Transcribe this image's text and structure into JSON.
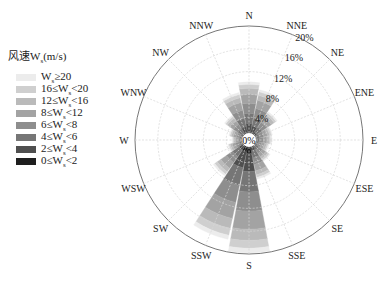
{
  "chart_data": {
    "type": "wind-rose",
    "title": "",
    "legend_title": "风速W_s(m/s)",
    "legend_position": "left",
    "radial_unit": "%",
    "radial_ticks": [
      "0%",
      "4%",
      "8%",
      "12%",
      "16%",
      "20%"
    ],
    "radial_max": 20,
    "grid": true,
    "directions": [
      "N",
      "NNE",
      "NE",
      "ENE",
      "E",
      "ESE",
      "SE",
      "SSE",
      "S",
      "SSW",
      "SW",
      "WSW",
      "W",
      "WNW",
      "NW",
      "NNW"
    ],
    "bins": [
      {
        "label": "W_s≥20",
        "color": "#ececec"
      },
      {
        "label": "16≤W_s<20",
        "color": "#cfcfcf"
      },
      {
        "label": "12≤W_s<16",
        "color": "#bababa"
      },
      {
        "label": "8≤W_s<12",
        "color": "#a3a3a3"
      },
      {
        "label": "6≤W_s<8",
        "color": "#8e8e8e"
      },
      {
        "label": "4≤W_s<6",
        "color": "#767676"
      },
      {
        "label": "2≤W_s<4",
        "color": "#4f4f4f"
      },
      {
        "label": "0≤W_s<2",
        "color": "#1e1e1e"
      }
    ],
    "total_frequency_percent": [
      10.2,
      9.0,
      6.0,
      4.2,
      4.0,
      3.6,
      4.5,
      7.0,
      19.8,
      17.8,
      7.6,
      3.8,
      3.0,
      3.6,
      5.2,
      8.5
    ]
  },
  "legend": {
    "title": "风速W",
    "title_sub": "s",
    "title_unit": "(m/s)",
    "items": [
      {
        "pre": "W",
        "sub": "s",
        "post": "≥20",
        "color": "#ececec"
      },
      {
        "pre": "16≤W",
        "sub": "s",
        "post": "<20",
        "color": "#cfcfcf"
      },
      {
        "pre": "12≤W",
        "sub": "s",
        "post": "<16",
        "color": "#bababa"
      },
      {
        "pre": "8≤W",
        "sub": "s",
        "post": "<12",
        "color": "#a3a3a3"
      },
      {
        "pre": "6≤W",
        "sub": "s",
        "post": "<8",
        "color": "#8e8e8e"
      },
      {
        "pre": "4≤W",
        "sub": "s",
        "post": "<6",
        "color": "#767676"
      },
      {
        "pre": "2≤W",
        "sub": "s",
        "post": "<4",
        "color": "#4f4f4f"
      },
      {
        "pre": "0≤W",
        "sub": "s",
        "post": "<2",
        "color": "#1e1e1e"
      }
    ]
  }
}
